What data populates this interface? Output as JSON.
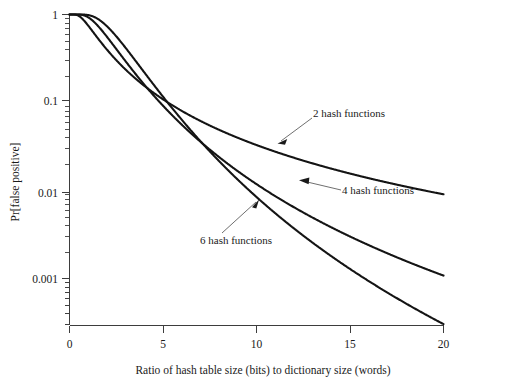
{
  "chart_data": {
    "type": "line",
    "title": "",
    "xlabel": "Ratio of hash table size (bits) to dictionary size (words)",
    "ylabel": "Pr[false positive]",
    "xlim": [
      0,
      20
    ],
    "ylim": [
      0.0003,
      1
    ],
    "yscale": "log",
    "xscale": "linear",
    "grid": false,
    "legend": "annotations-on-curves",
    "xticks": [
      "0",
      "5",
      "10",
      "15",
      "20"
    ],
    "xtick_values": [
      0,
      5,
      10,
      15,
      20
    ],
    "yticks": [
      "1",
      "0.1",
      "0.01",
      "0.001"
    ],
    "ytick_values": [
      1,
      0.1,
      0.01,
      0.001
    ],
    "series": [
      {
        "name": "2 hash functions",
        "k": 2,
        "x": [
          0,
          1,
          2,
          3,
          4,
          5,
          6,
          7,
          8,
          9,
          10,
          11,
          12,
          13,
          14,
          15,
          16,
          17,
          18,
          19,
          20
        ],
        "values": [
          1.0,
          0.7995,
          0.3996,
          0.2136,
          0.134,
          0.0925,
          0.0682,
          0.0527,
          0.0421,
          0.0345,
          0.0289,
          0.0246,
          0.0212,
          0.0185,
          0.0163,
          0.0145,
          0.013,
          0.0117,
          0.0106,
          0.0097,
          0.0089
        ]
      },
      {
        "name": "4 hash functions",
        "k": 4,
        "x": [
          0,
          1,
          2,
          3,
          4,
          5,
          6,
          7,
          8,
          9,
          10,
          11,
          12,
          13,
          14,
          15,
          16,
          17,
          18,
          19,
          20
        ],
        "values": [
          1.0,
          0.9839,
          0.6357,
          0.2832,
          0.1195,
          0.0509,
          0.0231,
          0.0113,
          0.006,
          0.0034,
          0.0021,
          0.00136,
          0.00093,
          0.00066,
          0.00048,
          0.00036,
          0.00028,
          0.00022,
          0.00017,
          0.00014,
          0.00012
        ]
      },
      {
        "name": "6 hash functions",
        "k": 6,
        "x": [
          0,
          1,
          2,
          3,
          4,
          5,
          6,
          7,
          8,
          9,
          10,
          11,
          12,
          13,
          14,
          15,
          16,
          17,
          18,
          19,
          20
        ],
        "values": [
          1.0,
          0.9991,
          0.7587,
          0.3073,
          0.0935,
          0.0253,
          0.007,
          0.0022,
          0.00076,
          0.0003,
          0.00013,
          6e-05,
          3e-05,
          1.6e-05,
          9e-06,
          5e-06,
          3e-06,
          2e-06,
          1.3e-06,
          9e-07,
          6e-07
        ]
      }
    ],
    "annotations": [
      {
        "text": "2 hash functions",
        "target_x": 11.2,
        "target_y": 0.026
      },
      {
        "text": "4 hash functions",
        "target_x": 12.4,
        "target_y": 0.0125
      },
      {
        "text": "6 hash functions",
        "target_x": 10.1,
        "target_y": 0.0093
      }
    ]
  },
  "axes": {
    "y_title": "Pr[false positive]",
    "x_title": "Ratio of hash table size (bits) to dictionary size (words)",
    "x_tick_labels": [
      "0",
      "5",
      "10",
      "15",
      "20"
    ],
    "y_tick_labels": [
      "1",
      "0.1",
      "0.01",
      "0.001"
    ]
  },
  "labels": {
    "series_2": "2 hash functions",
    "series_4": "4 hash functions",
    "series_6": "6 hash functions"
  },
  "colors": {
    "curve": "#141414",
    "axis": "#3d3d3d",
    "text": "#1a1a1a",
    "background": "#ffffff"
  }
}
